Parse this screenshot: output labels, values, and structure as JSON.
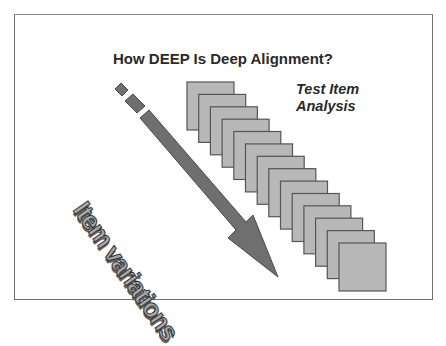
{
  "slide": {
    "title": "How DEEP Is Deep Alignment?",
    "label_line1": "Test Item",
    "label_line2": "Analysis",
    "arrow_label": "Item variations"
  },
  "diagram": {
    "arrow_icon": "down-right-arrow",
    "stack_count": 14,
    "colors": {
      "square_fill": "#b8b8b8",
      "square_border": "#555555",
      "arrow_fill": "#6f6f6f",
      "arrow_border": "#4a4a4a",
      "text": "#2a2a2a"
    }
  }
}
